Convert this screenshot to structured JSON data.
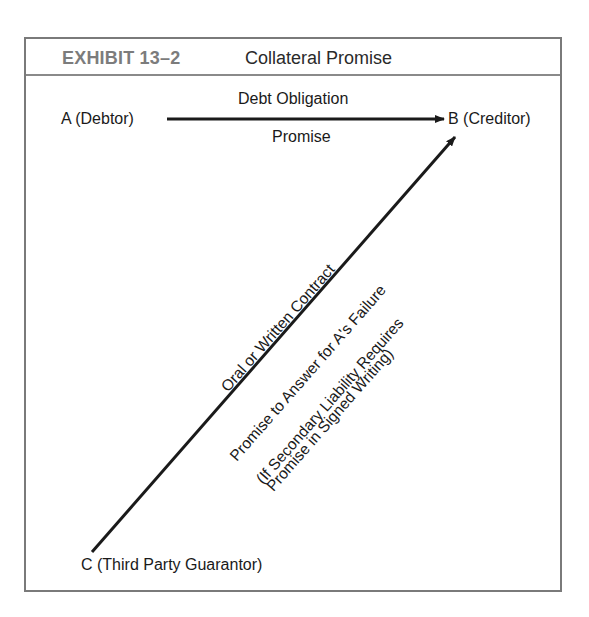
{
  "exhibit": {
    "number": "EXHIBIT 13–2",
    "title": "Collateral Promise"
  },
  "parties": {
    "a": "A (Debtor)",
    "b": "B (Creditor)",
    "c": "C (Third Party Guarantor)"
  },
  "horizontal_arrow": {
    "label_above": "Debt Obligation",
    "label_below": "Promise",
    "from": "A (Debtor)",
    "to": "B (Creditor)"
  },
  "diagonal_arrow": {
    "from": "C (Third Party Guarantor)",
    "to": "B (Creditor)",
    "label_above": "Oral or Written Contract",
    "label_below_1": "Promise to Answer for A's Failure",
    "label_below_2": "(If Secondary Liability Requires",
    "label_below_3": "Promise in Signed Writing)"
  },
  "colors": {
    "frame_border": "#7a7a7a",
    "exhibit_number": "#7c7c7c",
    "ink": "#1a1a1a"
  }
}
